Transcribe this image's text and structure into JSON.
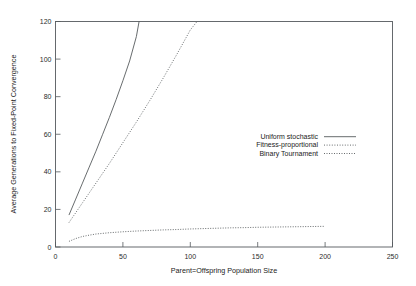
{
  "chart_data": {
    "type": "line",
    "title": "",
    "xlabel": "Parent=Offspring Population Size",
    "ylabel": "Average Generations to Fixed-Point Convergence",
    "xlim": [
      0,
      250
    ],
    "ylim": [
      0,
      120
    ],
    "xticks": [
      0,
      50,
      100,
      150,
      200,
      250
    ],
    "yticks": [
      0,
      20,
      40,
      60,
      80,
      100,
      120
    ],
    "grid": false,
    "legend_position": "center-right",
    "series": [
      {
        "name": "Uniform stochastic",
        "style": "solid",
        "color": "#4d5154",
        "x": [
          10,
          15,
          20,
          25,
          30,
          35,
          40,
          45,
          50,
          55,
          60,
          62
        ],
        "y": [
          17.0,
          25.5,
          34.0,
          42.5,
          51.0,
          60.0,
          69.0,
          78.5,
          88.5,
          99.0,
          112.0,
          120.0
        ]
      },
      {
        "name": "Fitness-proportional",
        "style": "dotted",
        "color": "#4d5154",
        "x": [
          10,
          20,
          30,
          40,
          50,
          60,
          70,
          80,
          90,
          100,
          105
        ],
        "y": [
          13.0,
          23.5,
          34.0,
          44.5,
          55.5,
          66.5,
          78.0,
          90.0,
          102.5,
          115.5,
          120.0
        ]
      },
      {
        "name": "Binary Tournament",
        "style": "dashdot",
        "color": "#4d5154",
        "x": [
          10,
          15,
          20,
          25,
          30,
          40,
          50,
          60,
          70,
          80,
          90,
          100,
          110,
          120,
          130,
          140,
          150,
          160,
          170,
          180,
          190,
          200
        ],
        "y": [
          3.0,
          4.5,
          5.6,
          6.3,
          6.9,
          7.6,
          8.1,
          8.5,
          8.8,
          9.1,
          9.3,
          9.6,
          9.8,
          10.0,
          10.2,
          10.3,
          10.5,
          10.6,
          10.7,
          10.8,
          10.9,
          11.0
        ]
      }
    ]
  },
  "legend": {
    "entries": [
      {
        "label": "Uniform stochastic"
      },
      {
        "label": "Fitness-proportional"
      },
      {
        "label": "Binary Tournament"
      }
    ]
  },
  "axes": {
    "x_label": "Parent=Offspring Population Size",
    "y_label": "Average Generations to Fixed-Point Convergence",
    "x_tick_labels": [
      "0",
      "50",
      "100",
      "150",
      "200",
      "250"
    ],
    "y_tick_labels": [
      "0",
      "20",
      "40",
      "60",
      "80",
      "100",
      "120"
    ]
  },
  "style": {
    "axis_color": "#555a5e",
    "series_color": "#4d5154",
    "background": "#ffffff"
  }
}
